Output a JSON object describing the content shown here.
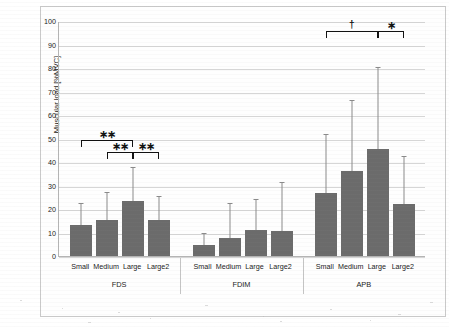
{
  "chart_data": {
    "type": "bar",
    "title": "",
    "xlabel": "",
    "ylabel": "Muscular load [%MVC]",
    "ylim": [
      0,
      100
    ],
    "ytick_labels": [
      "0",
      "10",
      "20",
      "30",
      "40",
      "50",
      "60",
      "70",
      "80",
      "90",
      "100"
    ],
    "ytick_values": [
      0,
      10,
      20,
      30,
      40,
      50,
      60,
      70,
      80,
      90,
      100
    ],
    "grid": true,
    "legend": "none",
    "categories": [
      "Small",
      "Medium",
      "Large",
      "Large2"
    ],
    "groups": [
      "FDS",
      "FDIM",
      "APB"
    ],
    "bar_color": "#6b6b6b",
    "error_color": "#8a8a8a",
    "series": [
      {
        "name": "FDS",
        "values": [
          13.0,
          15.5,
          23.5,
          15.5
        ],
        "error_upper": [
          22.0,
          27.0,
          37.5,
          25.0
        ]
      },
      {
        "name": "FDIM",
        "values": [
          4.5,
          7.5,
          11.0,
          10.5
        ],
        "error_upper": [
          9.5,
          22.0,
          24.0,
          31.0
        ]
      },
      {
        "name": "APB",
        "values": [
          27.0,
          36.0,
          45.5,
          22.0
        ],
        "error_upper": [
          51.5,
          66.0,
          80.0,
          42.0
        ]
      }
    ],
    "annotations": [
      {
        "group": "FDS",
        "from": "Small",
        "to": "Large",
        "marker": "∗∗",
        "y": 50.0
      },
      {
        "group": "FDS",
        "from": "Medium",
        "to": "Large",
        "marker": "∗∗",
        "y": 44.5
      },
      {
        "group": "FDS",
        "from": "Large",
        "to": "Large2",
        "marker": "∗∗",
        "y": 44.5
      },
      {
        "group": "APB",
        "from": "Small",
        "to": "Large",
        "marker": "†",
        "y": 96.0
      },
      {
        "group": "APB",
        "from": "Large",
        "to": "Large2",
        "marker": "∗",
        "y": 96.0
      }
    ]
  }
}
